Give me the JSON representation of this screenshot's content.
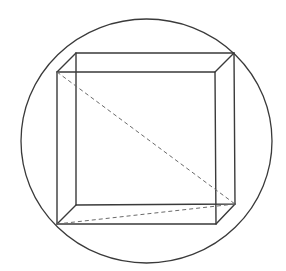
{
  "diagram": {
    "title": "",
    "colors": {
      "background": "#ffffff",
      "line": "#3a3a3a",
      "dashed": "#6a6a6a"
    },
    "sphere": {
      "cx": 146.5,
      "cy": 141,
      "rx": 125.5,
      "ry": 122
    },
    "cube": {
      "front_face": {
        "top_left": [
          57,
          72
        ],
        "top_right": [
          215,
          72
        ],
        "bottom_right": [
          216,
          224
        ],
        "bottom_left": [
          57,
          224
        ]
      },
      "back_face": {
        "top_left": [
          76,
          53
        ],
        "top_right": [
          234,
          53
        ],
        "bottom_right": [
          235,
          204
        ],
        "bottom_left": [
          76,
          205
        ]
      }
    },
    "dashed_lines": [
      {
        "name": "space-diagonal",
        "from": [
          57,
          72
        ],
        "to": [
          235,
          204
        ]
      },
      {
        "name": "base-diagonal",
        "from": [
          57,
          224
        ],
        "to": [
          235,
          204
        ]
      }
    ],
    "labels": []
  }
}
